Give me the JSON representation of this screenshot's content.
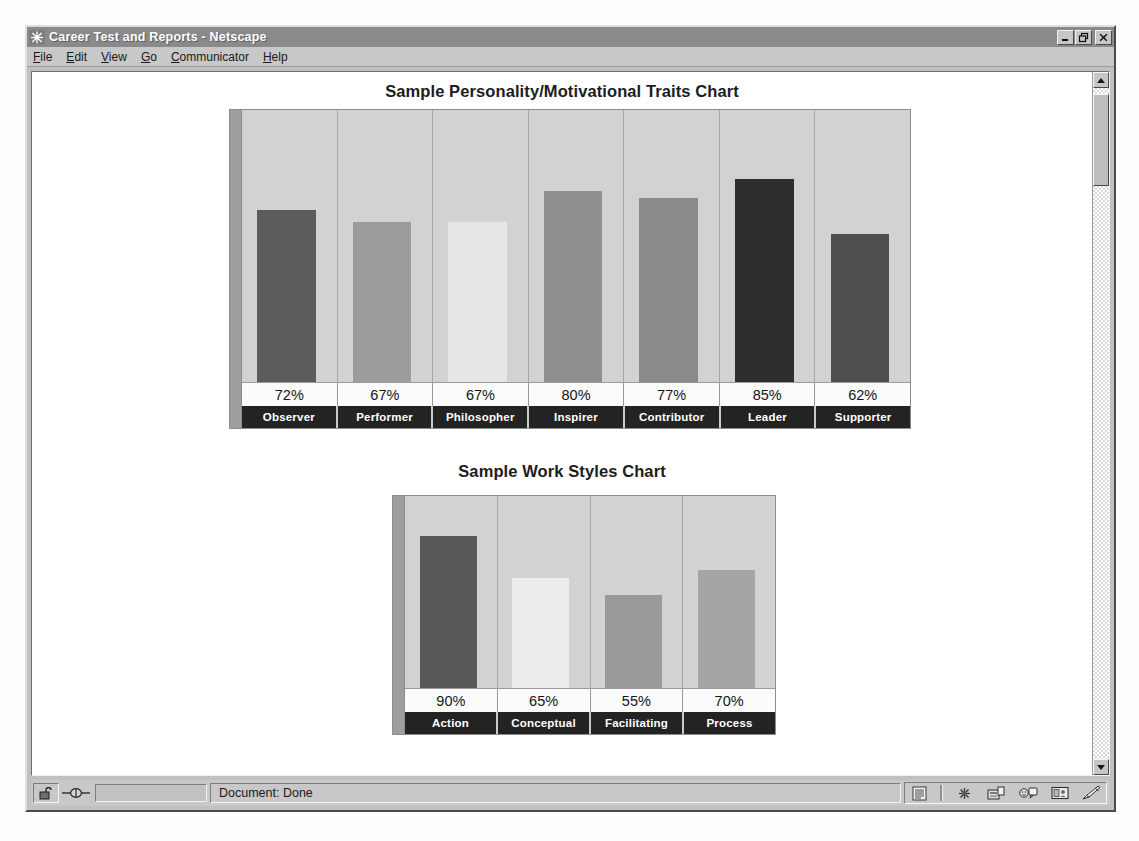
{
  "window": {
    "title": "Career Test and Reports - Netscape",
    "app_icon": "netscape-starburst-icon",
    "controls": {
      "minimize": "_",
      "restore": "❐",
      "close": "✕"
    }
  },
  "menubar": {
    "items": [
      {
        "label": "File",
        "mnemonic": "F"
      },
      {
        "label": "Edit",
        "mnemonic": "E"
      },
      {
        "label": "View",
        "mnemonic": "V"
      },
      {
        "label": "Go",
        "mnemonic": "G"
      },
      {
        "label": "Communicator",
        "mnemonic": "C"
      },
      {
        "label": "Help",
        "mnemonic": "H"
      }
    ]
  },
  "statusbar": {
    "message": "Document: Done",
    "lock_icon": "padlock-open-icon",
    "connection_icon": "connection-icon",
    "component_icons": [
      "navigator-icon",
      "mailbox-icon",
      "newsgroups-icon",
      "address-book-icon",
      "composer-icon"
    ]
  },
  "scrollbar": {
    "up_arrow": "scroll-up-icon",
    "down_arrow": "scroll-down-icon"
  },
  "chart_data": [
    {
      "type": "bar",
      "title": "Sample Personality/Motivational Traits Chart",
      "xlabel": "",
      "ylabel": "",
      "ylim": [
        0,
        100
      ],
      "grid": false,
      "legend": "none",
      "categories": [
        "Observer",
        "Performer",
        "Philosopher",
        "Inspirer",
        "Contributor",
        "Leader",
        "Supporter"
      ],
      "values": [
        72,
        67,
        67,
        80,
        77,
        85,
        62
      ],
      "value_labels": [
        "72%",
        "67%",
        "67%",
        "80%",
        "77%",
        "85%",
        "62%"
      ],
      "bar_colors": [
        "#5c5c5c",
        "#9c9c9c",
        "#e6e6e6",
        "#8f8f8f",
        "#8a8a8a",
        "#2e2e2e",
        "#4f4f4f"
      ],
      "plot_background": "#d2d2d2",
      "axis_color": "#9e9e9e"
    },
    {
      "type": "bar",
      "title": "Sample Work Styles Chart",
      "xlabel": "",
      "ylabel": "",
      "ylim": [
        0,
        100
      ],
      "grid": false,
      "legend": "none",
      "categories": [
        "Action",
        "Conceptual",
        "Facilitating",
        "Process"
      ],
      "values": [
        90,
        65,
        55,
        70
      ],
      "value_labels": [
        "90%",
        "65%",
        "55%",
        "70%"
      ],
      "bar_colors": [
        "#585858",
        "#ededed",
        "#9a9a9a",
        "#a5a5a5"
      ],
      "plot_background": "#d2d2d2",
      "axis_color": "#9e9e9e"
    }
  ]
}
